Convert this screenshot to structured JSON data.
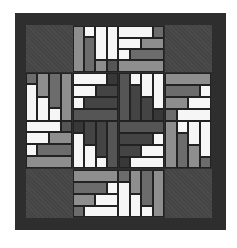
{
  "image": {
    "description": "Quilt block pattern: log-cabin style rotating strips in grayscale on a dark border",
    "palette": {
      "border": "#2e2e2e",
      "corner": "#454545",
      "white": "#f6f6f6",
      "light_gray": "#8e8e8e",
      "mid_gray": "#6c6c6c",
      "dark_gray": "#555555",
      "darker_gray": "#444444",
      "darkest_gray": "#383838",
      "seam": "#222222"
    },
    "layout": {
      "board": [
        15,
        13,
        211,
        217
      ],
      "grid_columns_px": [
        26,
        73,
        119,
        165,
        212
      ],
      "grid_rows_px": [
        25,
        72,
        121,
        169,
        218
      ],
      "corner_blocks": [
        "top-left",
        "top-right",
        "bottom-left",
        "bottom-right"
      ],
      "edge_blocks": [
        "top",
        "right",
        "bottom",
        "left"
      ],
      "center_blocks": [
        "center-top-left",
        "center-top-right",
        "center-bottom-left",
        "center-bottom-right"
      ]
    }
  }
}
